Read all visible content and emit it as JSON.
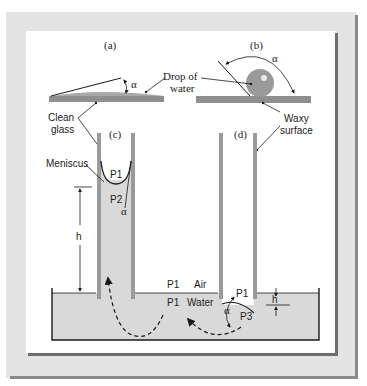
{
  "figure": {
    "panels": {
      "a": {
        "label": "(a)",
        "description": "Water drop spreading on clean glass, small contact angle"
      },
      "b": {
        "label": "(b)",
        "description": "Water drop beading on waxy surface, large contact angle"
      },
      "c": {
        "label": "(c)",
        "description": "Capillary rise in clean glass tube"
      },
      "d": {
        "label": "(d)",
        "description": "Capillary depression in waxy tube"
      }
    },
    "labels": {
      "alpha": "α",
      "drop_of_water_line1": "Drop of",
      "drop_of_water_line2": "water",
      "clean_glass_line1": "Clean",
      "clean_glass_line2": "glass",
      "waxy_surface_line1": "Waxy",
      "waxy_surface_line2": "surface",
      "meniscus": "Meniscus",
      "p1": "P1",
      "p2": "P2",
      "p3": "P3",
      "h": "h",
      "air": "Air",
      "water": "Water"
    },
    "colors": {
      "frame": "#e3e3e3",
      "frame_shadow": "#8a8a8a",
      "panel": "#ffffff",
      "surface": "#8f8f8f",
      "water": "#d9d9d9",
      "drop": "#9a9a9a",
      "line": "#1a1a1a"
    }
  }
}
